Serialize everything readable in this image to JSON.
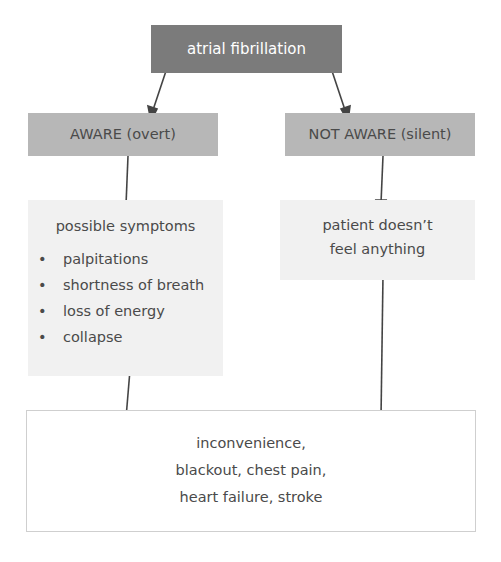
{
  "diagram": {
    "top": {
      "label": "atrial fibrillation"
    },
    "aware": {
      "label": "AWARE (overt)"
    },
    "not_aware": {
      "label": "NOT AWARE (silent)"
    },
    "symptoms": {
      "title": "possible symptoms",
      "bullet": "•",
      "items": [
        "palpitations",
        "shortness of breath",
        "loss of energy",
        "collapse"
      ]
    },
    "patient": {
      "lines": [
        "patient doesn’t",
        "feel anything"
      ]
    },
    "outcome": {
      "lines": [
        "inconvenience,",
        "blackout, chest pain,",
        "heart failure, stroke"
      ]
    }
  },
  "colors": {
    "top_box": "#7b7b7b",
    "mid_box": "#b7b7b7",
    "light_box": "#f1f1f1",
    "arrow": "#444444",
    "text": "#4a4a4a"
  }
}
